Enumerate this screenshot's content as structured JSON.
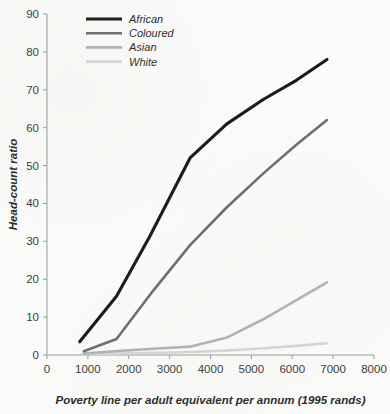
{
  "chart_data": {
    "type": "line",
    "title": "",
    "xlabel": "Poverty line per adult equivalent per annum (1995 rands)",
    "ylabel": "Head-count ratio",
    "xlim": [
      0,
      8000
    ],
    "ylim": [
      0,
      90
    ],
    "xticks": [
      0,
      1000,
      2000,
      3000,
      4000,
      5000,
      6000,
      7000,
      8000
    ],
    "yticks": [
      0,
      10,
      20,
      30,
      40,
      50,
      60,
      70,
      80,
      90
    ],
    "xtick_labels": [
      "0",
      "1000",
      "2000",
      "3000",
      "4000",
      "5000",
      "6000",
      "7000",
      "8000"
    ],
    "ytick_labels": [
      "0",
      "10",
      "20",
      "30",
      "40",
      "50",
      "60",
      "70",
      "80",
      "90"
    ],
    "grid": false,
    "legend_position": "top-left",
    "series": [
      {
        "name": "African",
        "color": "#1a1a1a",
        "width": 3.1,
        "x": [
          800,
          1700,
          2500,
          3500,
          4400,
          5300,
          6100,
          6850
        ],
        "y": [
          3.5,
          15.5,
          31.0,
          52.0,
          61.0,
          67.5,
          72.5,
          78.0
        ]
      },
      {
        "name": "Coloured",
        "color": "#6e6e6e",
        "width": 2.6,
        "x": [
          900,
          1700,
          2600,
          3500,
          4400,
          5300,
          6100,
          6850
        ],
        "y": [
          1.0,
          4.2,
          17.0,
          29.0,
          39.0,
          48.0,
          55.5,
          62.0
        ]
      },
      {
        "name": "Asian",
        "color": "#b2b2b2",
        "width": 2.6,
        "x": [
          900,
          1800,
          2700,
          3500,
          4400,
          5300,
          6100,
          6850
        ],
        "y": [
          0.4,
          1.1,
          1.7,
          2.2,
          4.6,
          9.5,
          14.5,
          19.2
        ]
      },
      {
        "name": "White",
        "color": "#d6d6d6",
        "width": 2.6,
        "x": [
          900,
          1800,
          2700,
          3500,
          4400,
          5300,
          6100,
          6850
        ],
        "y": [
          0.2,
          0.4,
          0.6,
          0.8,
          1.2,
          1.8,
          2.4,
          3.1
        ]
      }
    ],
    "legend_entries": [
      {
        "label": "African",
        "color": "#1a1a1a"
      },
      {
        "label": "Coloured",
        "color": "#6e6e6e"
      },
      {
        "label": "Asian",
        "color": "#b2b2b2"
      },
      {
        "label": "White",
        "color": "#d6d6d6"
      }
    ]
  }
}
